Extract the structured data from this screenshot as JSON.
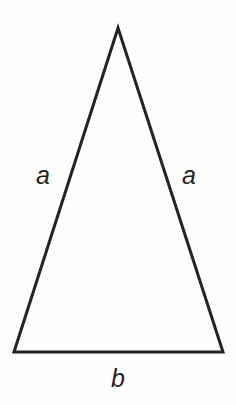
{
  "figure": {
    "background_color": "#fefefe",
    "stroke_color": "#232323",
    "text_color": "#232323",
    "width": 236,
    "height": 405
  },
  "shape": {
    "name": "isosceles-triangle",
    "stroke_width": 3,
    "vertices": {
      "apex": {
        "x": 118,
        "y": 28
      },
      "bottom_left": {
        "x": 14,
        "y": 352
      },
      "bottom_right": {
        "x": 223,
        "y": 352
      }
    },
    "points_attr": "118,28 14,352 223,352"
  },
  "labels": {
    "left_side": "a",
    "right_side": "a",
    "base": "b"
  }
}
